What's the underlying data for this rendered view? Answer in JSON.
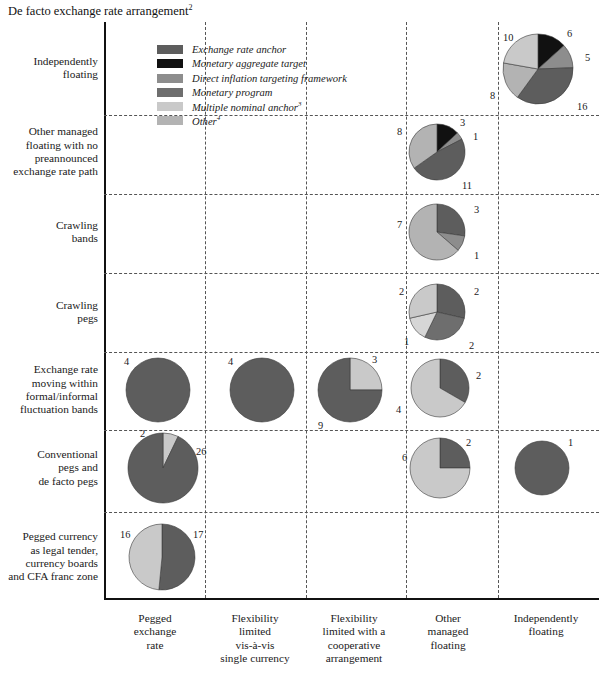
{
  "title": "De facto exchange rate arrangement",
  "title_superscript": "2",
  "legend": {
    "items": [
      {
        "label": "Exchange rate anchor",
        "color": "#5d5d5d",
        "sup": ""
      },
      {
        "label": "Monetary aggregate target",
        "color": "#111111",
        "sup": ""
      },
      {
        "label": "Direct inflation targeting framework",
        "color": "#8d8d8d",
        "sup": ""
      },
      {
        "label": "Monetary program",
        "color": "#6e6e6e",
        "sup": ""
      },
      {
        "label": "Multiple nominal anchor",
        "color": "#c9c9c9",
        "sup": "3"
      },
      {
        "label": "Other",
        "color": "#b3b3b3",
        "sup": "4"
      }
    ]
  },
  "rows": [
    {
      "id": "independently-floating",
      "label": "Independently\nfloating"
    },
    {
      "id": "other-managed-floating",
      "label": "Other managed\nfloating with no\npreannounced\nexchange rate path"
    },
    {
      "id": "crawling-bands",
      "label": "Crawling\nbands"
    },
    {
      "id": "crawling-pegs",
      "label": "Crawling\npegs"
    },
    {
      "id": "exchange-rate-moving-within-bands",
      "label": "Exchange rate\nmoving within\nformal/informal\nfluctuation bands"
    },
    {
      "id": "conventional-pegs",
      "label": "Conventional\npegs and\nde facto pegs"
    },
    {
      "id": "pegged-currency",
      "label": "Pegged currency\nas legal tender,\ncurrency boards\nand CFA franc zone"
    }
  ],
  "columns": [
    {
      "id": "pegged-exchange-rate",
      "label": "Pegged\nexchange\nrate"
    },
    {
      "id": "flexibility-limited-single-currency",
      "label": "Flexibility\nlimited\nvis-à-vis\nsingle currency"
    },
    {
      "id": "flexibility-limited-cooperative",
      "label": "Flexibility\nlimited with a\ncooperative\narrangement"
    },
    {
      "id": "other-managed-floating",
      "label": "Other\nmanaged\nfloating"
    },
    {
      "id": "independently-floating",
      "label": "Independently\nfloating"
    }
  ],
  "chart_data": {
    "type": "pie",
    "title": "De facto exchange rate arrangement",
    "xlabel": "",
    "ylabel": "",
    "grid": true,
    "legend_position": "top-center",
    "categories": [
      "Exchange rate anchor",
      "Monetary aggregate target",
      "Direct inflation targeting framework",
      "Monetary program",
      "Multiple nominal anchor",
      "Other"
    ],
    "category_colors": [
      "#5d5d5d",
      "#111111",
      "#8d8d8d",
      "#6e6e6e",
      "#c9c9c9",
      "#b3b3b3"
    ],
    "row_categories": [
      "Independently floating",
      "Other managed floating with no preannounced exchange rate path",
      "Crawling bands",
      "Crawling pegs",
      "Exchange rate moving within formal/informal fluctuation bands",
      "Conventional pegs and de facto pegs",
      "Pegged currency as legal tender, currency boards and CFA franc zone"
    ],
    "column_categories": [
      "Pegged exchange rate",
      "Flexibility limited vis-à-vis single currency",
      "Flexibility limited with a cooperative arrangement",
      "Other managed floating",
      "Independently floating"
    ],
    "pies": [
      {
        "row": "Independently floating",
        "column": "Independently floating",
        "cx": 538,
        "cy": 69,
        "r": 35,
        "slices": [
          {
            "category": "Monetary aggregate target",
            "value": 6,
            "color": "#111111",
            "label": "6",
            "label_x": 567,
            "label_y": 28
          },
          {
            "category": "Direct inflation targeting framework",
            "value": 5,
            "color": "#8d8d8d",
            "label": "5",
            "label_x": 585,
            "label_y": 52
          },
          {
            "category": "Exchange rate anchor",
            "value": 16,
            "color": "#5d5d5d",
            "label": "16",
            "label_x": 577,
            "label_y": 101
          },
          {
            "category": "Other",
            "value": 8,
            "color": "#b3b3b3",
            "label": "8",
            "label_x": 490,
            "label_y": 90
          },
          {
            "category": "Multiple nominal anchor",
            "value": 10,
            "color": "#c9c9c9",
            "label": "10",
            "label_x": 503,
            "label_y": 32
          }
        ]
      },
      {
        "row": "Other managed floating with no preannounced exchange rate path",
        "column": "Other managed floating",
        "cx": 437,
        "cy": 152,
        "r": 28,
        "slices": [
          {
            "category": "Monetary aggregate target",
            "value": 3,
            "color": "#111111",
            "label": "3",
            "label_x": 460,
            "label_y": 117
          },
          {
            "category": "Direct inflation targeting framework",
            "value": 1,
            "color": "#8d8d8d",
            "label": "1",
            "label_x": 473,
            "label_y": 131
          },
          {
            "category": "Exchange rate anchor",
            "value": 11,
            "color": "#5d5d5d",
            "label": "11",
            "label_x": 462,
            "label_y": 180
          },
          {
            "category": "Other",
            "value": 8,
            "color": "#b3b3b3",
            "label": "8",
            "label_x": 397,
            "label_y": 126
          }
        ]
      },
      {
        "row": "Crawling bands",
        "column": "Other managed floating",
        "cx": 437,
        "cy": 232,
        "r": 28,
        "slices": [
          {
            "category": "Exchange rate anchor",
            "value": 3,
            "color": "#5d5d5d",
            "label": "3",
            "label_x": 474,
            "label_y": 204
          },
          {
            "category": "Direct inflation targeting framework",
            "value": 1,
            "color": "#8d8d8d",
            "label": "1",
            "label_x": 474,
            "label_y": 250
          },
          {
            "category": "Other",
            "value": 7,
            "color": "#b3b3b3",
            "label": "7",
            "label_x": 397,
            "label_y": 219
          }
        ]
      },
      {
        "row": "Crawling pegs",
        "column": "Other managed floating",
        "cx": 437,
        "cy": 312,
        "r": 28,
        "slices": [
          {
            "category": "Exchange rate anchor",
            "value": 2,
            "color": "#5d5d5d",
            "label": "2",
            "label_x": 474,
            "label_y": 286
          },
          {
            "category": "Monetary program",
            "value": 2,
            "color": "#6e6e6e",
            "label": "2",
            "label_x": 469,
            "label_y": 340
          },
          {
            "category": "Other",
            "value": 1,
            "color": "#d6d6d6",
            "label": "1",
            "label_x": 404,
            "label_y": 336
          },
          {
            "category": "Multiple nominal anchor",
            "value": 2,
            "color": "#c9c9c9",
            "label": "2",
            "label_x": 399,
            "label_y": 286
          }
        ]
      },
      {
        "row": "Exchange rate moving within formal/informal fluctuation bands",
        "column": "Pegged exchange rate",
        "cx": 158,
        "cy": 390,
        "r": 32,
        "slices": [
          {
            "category": "Exchange rate anchor",
            "value": 4,
            "color": "#5d5d5d",
            "label": "4",
            "label_x": 124,
            "label_y": 356
          }
        ]
      },
      {
        "row": "Exchange rate moving within formal/informal fluctuation bands",
        "column": "Flexibility limited vis-à-vis single currency",
        "cx": 262,
        "cy": 390,
        "r": 32,
        "slices": [
          {
            "category": "Exchange rate anchor",
            "value": 4,
            "color": "#5d5d5d",
            "label": "4",
            "label_x": 228,
            "label_y": 356
          }
        ]
      },
      {
        "row": "Exchange rate moving within formal/informal fluctuation bands",
        "column": "Flexibility limited with a cooperative arrangement",
        "cx": 350,
        "cy": 390,
        "r": 32,
        "slices": [
          {
            "category": "Multiple nominal anchor",
            "value": 3,
            "color": "#c9c9c9",
            "label": "3",
            "label_x": 372,
            "label_y": 354
          },
          {
            "category": "Exchange rate anchor",
            "value": 9,
            "color": "#5d5d5d",
            "label": "9",
            "label_x": 318,
            "label_y": 420
          }
        ]
      },
      {
        "row": "Exchange rate moving within formal/informal fluctuation bands",
        "column": "Other managed floating",
        "cx": 440,
        "cy": 388,
        "r": 29,
        "slices": [
          {
            "category": "Exchange rate anchor",
            "value": 2,
            "color": "#5d5d5d",
            "label": "2",
            "label_x": 476,
            "label_y": 370
          },
          {
            "category": "Multiple nominal anchor",
            "value": 4,
            "color": "#c9c9c9",
            "label": "4",
            "label_x": 396,
            "label_y": 404
          }
        ]
      },
      {
        "row": "Conventional pegs and de facto pegs",
        "column": "Pegged exchange rate",
        "cx": 163,
        "cy": 468,
        "r": 35,
        "slices": [
          {
            "category": "Multiple nominal anchor",
            "value": 2,
            "color": "#c9c9c9",
            "label": "2",
            "label_x": 140,
            "label_y": 428
          },
          {
            "category": "Exchange rate anchor",
            "value": 26,
            "color": "#5d5d5d",
            "label": "26",
            "label_x": 196,
            "label_y": 446
          }
        ]
      },
      {
        "row": "Conventional pegs and de facto pegs",
        "column": "Other managed floating",
        "cx": 440,
        "cy": 468,
        "r": 30,
        "slices": [
          {
            "category": "Exchange rate anchor",
            "value": 2,
            "color": "#5d5d5d",
            "label": "2",
            "label_x": 466,
            "label_y": 437
          },
          {
            "category": "Multiple nominal anchor",
            "value": 6,
            "color": "#c9c9c9",
            "label": "6",
            "label_x": 402,
            "label_y": 452
          }
        ]
      },
      {
        "row": "Conventional pegs and de facto pegs",
        "column": "Independently floating",
        "cx": 542,
        "cy": 468,
        "r": 27,
        "slices": [
          {
            "category": "Exchange rate anchor",
            "value": 1,
            "color": "#5d5d5d",
            "label": "1",
            "label_x": 568,
            "label_y": 437
          }
        ]
      },
      {
        "row": "Pegged currency as legal tender, currency boards and CFA franc zone",
        "column": "Pegged exchange rate",
        "cx": 162,
        "cy": 557,
        "r": 33,
        "slices": [
          {
            "category": "Exchange rate anchor",
            "value": 17,
            "color": "#5d5d5d",
            "label": "17",
            "label_x": 193,
            "label_y": 529
          },
          {
            "category": "Multiple nominal anchor",
            "value": 16,
            "color": "#c9c9c9",
            "label": "16",
            "label_x": 120,
            "label_y": 529
          }
        ]
      }
    ]
  },
  "layout": {
    "col_dividers_x": [
      205,
      306,
      406,
      498
    ],
    "row_dividers_y": [
      115,
      194,
      273,
      352,
      430,
      512
    ],
    "row_label_centers_y": [
      68,
      152,
      232,
      312,
      390,
      468,
      557
    ],
    "col_label_centers_x": [
      155,
      255,
      354,
      448,
      546
    ]
  }
}
